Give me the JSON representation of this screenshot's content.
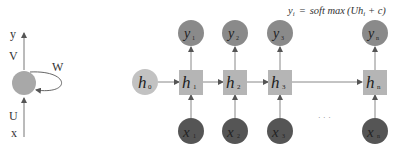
{
  "folded": {
    "output_label": "y",
    "output_weight": "V",
    "recurrent_weight": "W",
    "input_weight": "U",
    "input_label": "x"
  },
  "formula": {
    "lhs": "y",
    "lhs_sub": "i",
    "eq": "=",
    "rhs_func": "soft max",
    "rhs_open": "(Uh",
    "rhs_sub": "i",
    "rhs_close": " + c)"
  },
  "unfolded": {
    "initial": {
      "label": "h",
      "sub": "0"
    },
    "steps": [
      {
        "hidden": "h",
        "hidden_sub": "1",
        "output": "y",
        "output_sub": "1",
        "input": "x",
        "input_sub": "1"
      },
      {
        "hidden": "h",
        "hidden_sub": "2",
        "output": "y",
        "output_sub": "2",
        "input": "x",
        "input_sub": "2"
      },
      {
        "hidden": "h",
        "hidden_sub": "3",
        "output": "y",
        "output_sub": "3",
        "input": "x",
        "input_sub": "3"
      },
      {
        "hidden": "h",
        "hidden_sub": "n",
        "output": "y",
        "output_sub": "n",
        "input": "x",
        "input_sub": "n"
      }
    ],
    "ellipsis": "· · ·"
  },
  "colors": {
    "hidden_node": "#b5b5b5",
    "initial_node": "#c2c2c2",
    "output_node": "#8a8a8a",
    "input_node": "#555555",
    "edge": "#777777"
  }
}
